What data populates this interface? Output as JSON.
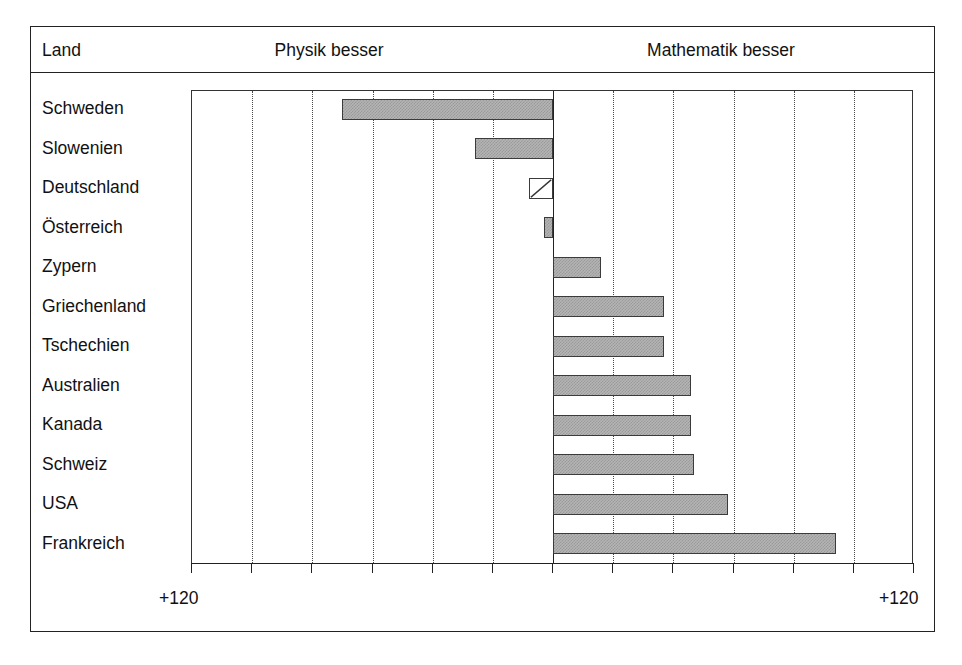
{
  "header": {
    "land_label": "Land",
    "left_side_label": "Physik besser",
    "right_side_label": "Mathematik besser"
  },
  "axis": {
    "left_end_label": "+120",
    "right_end_label": "+120"
  },
  "chart_data": {
    "type": "bar",
    "orientation": "horizontal",
    "title": "",
    "subtitle": "",
    "xlabel": "",
    "ylabel": "Land",
    "xlim": [
      -120,
      120
    ],
    "grid": true,
    "grid_axis": "x",
    "grid_style": "dotted",
    "legend": null,
    "annotations": [
      "Physik besser",
      "Mathematik besser"
    ],
    "tick_values": [
      -120,
      -100,
      -80,
      -60,
      -40,
      -20,
      0,
      20,
      40,
      60,
      80,
      100,
      120
    ],
    "tick_labels": [
      "+120",
      "",
      "",
      "",
      "",
      "",
      "",
      "",
      "",
      "",
      "",
      "",
      "+120"
    ],
    "categories": [
      "Schweden",
      "Slowenien",
      "Deutschland",
      "Österreich",
      "Zypern",
      "Griechenland",
      "Tschechien",
      "Australien",
      "Kanada",
      "Schweiz",
      "USA",
      "Frankreich"
    ],
    "values": [
      -70,
      -26,
      -8,
      -3,
      16,
      37,
      37,
      46,
      46,
      47,
      58,
      94
    ],
    "bar_styles": [
      "solid-gray",
      "solid-gray",
      "white-diagonal",
      "solid-gray",
      "solid-gray",
      "solid-gray",
      "solid-gray",
      "solid-gray",
      "solid-gray",
      "solid-gray",
      "solid-gray",
      "solid-gray"
    ],
    "colors": {
      "bar_fill": "#b4b4b4",
      "bar_border": "#3b3b3b",
      "highlight_fill": "#ffffff",
      "axis": "#222222",
      "grid": "#4a4a4a"
    }
  }
}
